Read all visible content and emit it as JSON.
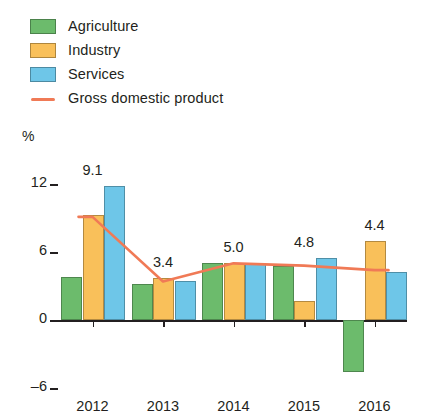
{
  "legend": {
    "items": [
      {
        "label": "Agriculture",
        "type": "swatch",
        "color": "#6cbb6c",
        "icon": "legend-swatch-agriculture"
      },
      {
        "label": "Industry",
        "type": "swatch",
        "color": "#f9c05a",
        "icon": "legend-swatch-industry"
      },
      {
        "label": "Services",
        "type": "swatch",
        "color": "#6ec6e8",
        "icon": "legend-swatch-services"
      },
      {
        "label": "Gross domestic product",
        "type": "line",
        "color": "#f07a56",
        "icon": "legend-line-gdp"
      }
    ]
  },
  "axis": {
    "unit": "%",
    "y_ticks": [
      "12",
      "6",
      "0",
      "-6"
    ],
    "x_ticks": [
      "2012",
      "2013",
      "2014",
      "2015",
      "2016"
    ]
  },
  "chart_data": {
    "type": "bar",
    "title": "",
    "subtitle": "",
    "xlabel": "",
    "ylabel": "%",
    "ylim": [
      -6,
      12
    ],
    "yticks": [
      -6,
      0,
      6,
      12
    ],
    "grid": false,
    "legend_position": "top-left",
    "categories": [
      "2012",
      "2013",
      "2014",
      "2015",
      "2016"
    ],
    "series": [
      {
        "name": "Agriculture",
        "type": "bar",
        "color": "#6cbb6c",
        "values": [
          3.8,
          3.2,
          5.0,
          4.8,
          -4.6
        ]
      },
      {
        "name": "Industry",
        "type": "bar",
        "color": "#f9c05a",
        "values": [
          9.3,
          3.7,
          5.0,
          1.7,
          7.0
        ]
      },
      {
        "name": "Services",
        "type": "bar",
        "color": "#6ec6e8",
        "values": [
          11.8,
          3.4,
          4.9,
          5.5,
          4.2
        ]
      },
      {
        "name": "Gross domestic product",
        "type": "line",
        "color": "#f07a56",
        "values": [
          9.1,
          3.4,
          5.0,
          4.8,
          4.4
        ]
      }
    ],
    "data_labels": [
      "9.1",
      "3.4",
      "5.0",
      "4.8",
      "4.4"
    ]
  }
}
